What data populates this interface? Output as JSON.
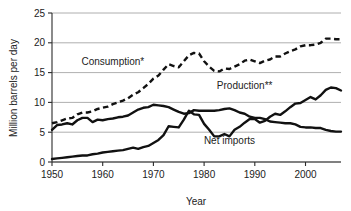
{
  "chart_data": {
    "type": "line",
    "title": "",
    "xlabel": "Year",
    "ylabel": "Million barrels per day",
    "xlim": [
      1950,
      2007
    ],
    "ylim": [
      0,
      25
    ],
    "grid": true,
    "legend_position": "inline-annotations",
    "xticks": [
      1950,
      1960,
      1970,
      1980,
      1990,
      2000
    ],
    "xtick_labels": [
      "1950",
      "1960",
      "1970",
      "1980",
      "1990",
      "2000"
    ],
    "yticks": [
      0,
      5,
      10,
      15,
      20,
      25
    ],
    "ytick_labels": [
      "0",
      "5",
      "10",
      "15",
      "20",
      "25"
    ],
    "annotations": [
      {
        "text": "Consumption*",
        "x": 1962,
        "y": 16.2
      },
      {
        "text": "Production**",
        "x": 1988,
        "y": 12.2
      },
      {
        "text": "Net imports",
        "x": 1985,
        "y": 3.0
      }
    ],
    "series": [
      {
        "name": "Consumption*",
        "style": "dashed",
        "x": [
          1950,
          1951,
          1952,
          1953,
          1954,
          1955,
          1956,
          1957,
          1958,
          1959,
          1960,
          1961,
          1962,
          1963,
          1964,
          1965,
          1966,
          1967,
          1968,
          1969,
          1970,
          1971,
          1972,
          1973,
          1974,
          1975,
          1976,
          1977,
          1978,
          1979,
          1980,
          1981,
          1982,
          1983,
          1984,
          1985,
          1986,
          1987,
          1988,
          1989,
          1990,
          1991,
          1992,
          1993,
          1994,
          1995,
          1996,
          1997,
          1998,
          1999,
          2000,
          2001,
          2002,
          2003,
          2004,
          2005,
          2006,
          2007
        ],
        "values": [
          6.5,
          6.7,
          7.0,
          7.3,
          7.4,
          8.0,
          8.3,
          8.3,
          8.5,
          8.9,
          9.1,
          9.3,
          9.7,
          10.0,
          10.3,
          10.7,
          11.3,
          11.7,
          12.4,
          13.1,
          14.0,
          14.5,
          15.5,
          16.4,
          16.1,
          15.9,
          16.9,
          17.9,
          18.3,
          18.2,
          16.9,
          16.0,
          15.3,
          15.2,
          15.7,
          15.6,
          16.0,
          16.4,
          17.0,
          17.2,
          16.9,
          16.6,
          17.0,
          17.2,
          17.7,
          17.7,
          18.2,
          18.6,
          18.9,
          19.4,
          19.6,
          19.6,
          19.7,
          20.0,
          20.7,
          20.7,
          20.6,
          20.6
        ]
      },
      {
        "name": "Production**",
        "style": "solid",
        "x": [
          1950,
          1951,
          1952,
          1953,
          1954,
          1955,
          1956,
          1957,
          1958,
          1959,
          1960,
          1961,
          1962,
          1963,
          1964,
          1965,
          1966,
          1967,
          1968,
          1969,
          1970,
          1971,
          1972,
          1973,
          1974,
          1975,
          1976,
          1977,
          1978,
          1979,
          1980,
          1981,
          1982,
          1983,
          1984,
          1985,
          1986,
          1987,
          1988,
          1989,
          1990,
          1991,
          1992,
          1993,
          1994,
          1995,
          1996,
          1997,
          1998,
          1999,
          2000,
          2001,
          2002,
          2003,
          2004,
          2005,
          2006,
          2007
        ],
        "values": [
          5.4,
          6.2,
          6.3,
          6.5,
          6.3,
          7.0,
          7.4,
          7.4,
          6.7,
          7.1,
          7.0,
          7.2,
          7.3,
          7.5,
          7.6,
          7.8,
          8.3,
          8.8,
          9.1,
          9.2,
          9.6,
          9.5,
          9.4,
          9.2,
          8.8,
          8.4,
          8.1,
          8.2,
          8.7,
          8.6,
          8.6,
          8.6,
          8.6,
          8.7,
          8.9,
          9.0,
          8.7,
          8.3,
          8.1,
          7.6,
          7.4,
          7.4,
          7.2,
          6.8,
          6.7,
          6.6,
          6.5,
          6.5,
          6.3,
          5.9,
          5.8,
          5.8,
          5.7,
          5.7,
          5.4,
          5.2,
          5.1,
          5.1
        ]
      },
      {
        "name": "Net imports",
        "style": "solid",
        "x": [
          1950,
          1951,
          1952,
          1953,
          1954,
          1955,
          1956,
          1957,
          1958,
          1959,
          1960,
          1961,
          1962,
          1963,
          1964,
          1965,
          1966,
          1967,
          1968,
          1969,
          1970,
          1971,
          1972,
          1973,
          1974,
          1975,
          1976,
          1977,
          1978,
          1979,
          1980,
          1981,
          1982,
          1983,
          1984,
          1985,
          1986,
          1987,
          1988,
          1989,
          1990,
          1991,
          1992,
          1993,
          1994,
          1995,
          1996,
          1997,
          1998,
          1999,
          2000,
          2001,
          2002,
          2003,
          2004,
          2005,
          2006,
          2007
        ],
        "values": [
          0.5,
          0.6,
          0.7,
          0.8,
          0.9,
          1.0,
          1.1,
          1.1,
          1.3,
          1.4,
          1.6,
          1.7,
          1.8,
          1.9,
          2.0,
          2.2,
          2.4,
          2.2,
          2.5,
          2.7,
          3.2,
          3.7,
          4.5,
          6.0,
          5.9,
          5.8,
          7.1,
          8.6,
          8.0,
          7.9,
          6.4,
          5.4,
          4.3,
          4.3,
          4.7,
          4.3,
          5.4,
          5.9,
          6.6,
          7.2,
          7.2,
          6.6,
          6.9,
          7.6,
          8.1,
          7.9,
          8.5,
          9.2,
          9.8,
          9.9,
          10.4,
          10.9,
          10.5,
          11.2,
          12.1,
          12.5,
          12.4,
          12.0
        ]
      }
    ]
  },
  "axes": {
    "y_title": "Million barrels per day",
    "x_title": "Year"
  }
}
